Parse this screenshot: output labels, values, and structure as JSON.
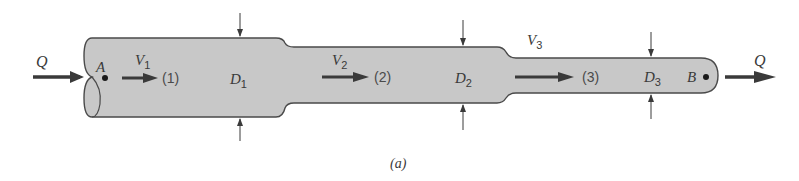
{
  "figure": {
    "caption": "(a)",
    "flow_label": "Q",
    "points": {
      "inlet": "A",
      "outlet": "B"
    },
    "sections": [
      {
        "station": "(1)",
        "velocity_symbol": "V",
        "velocity_sub": "1",
        "diameter_symbol": "D",
        "diameter_sub": "1"
      },
      {
        "station": "(2)",
        "velocity_symbol": "V",
        "velocity_sub": "2",
        "diameter_symbol": "D",
        "diameter_sub": "2"
      },
      {
        "station": "(3)",
        "velocity_symbol": "V",
        "velocity_sub": "3",
        "diameter_symbol": "D",
        "diameter_sub": "3"
      }
    ],
    "colors": {
      "pipe_fill": "#c8c8c8",
      "pipe_outline": "#4a4a4a",
      "arrow": "#3a3a3a"
    }
  }
}
